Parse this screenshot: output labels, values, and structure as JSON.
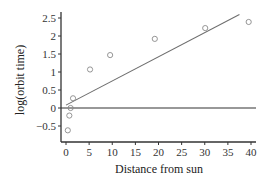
{
  "chart_data": {
    "type": "scatter",
    "title": "",
    "xlabel": "Distance from sun",
    "ylabel": "log(orbit time)",
    "xlim": [
      0,
      40
    ],
    "ylim": [
      -0.9,
      2.7
    ],
    "xticks": [
      0,
      5,
      10,
      15,
      20,
      25,
      30,
      35,
      40
    ],
    "xtick_labels": [
      "0",
      "5",
      "10",
      "15",
      "20",
      "25",
      "30",
      "35",
      "40"
    ],
    "yticks": [
      2.5,
      2,
      1.5,
      1,
      0.5,
      0,
      -0.5
    ],
    "ytick_labels": [
      "2.5",
      "2",
      "1.5",
      "1",
      "0.5",
      "0",
      "−0.5"
    ],
    "grid": false,
    "legend": null,
    "series": [
      {
        "name": "planets",
        "marker": "open-circle",
        "x": [
          0.39,
          0.72,
          1.0,
          1.52,
          5.2,
          9.54,
          19.2,
          30.1,
          39.5
        ],
        "y": [
          -0.62,
          -0.21,
          0.0,
          0.27,
          1.07,
          1.47,
          1.92,
          2.22,
          2.39
        ]
      }
    ],
    "reference_lines": [
      {
        "name": "zero-line",
        "type": "horizontal",
        "y": 0
      },
      {
        "name": "fit-line",
        "type": "line",
        "x": [
          0,
          37.5
        ],
        "y": [
          0.08,
          2.6
        ]
      }
    ],
    "colors": {
      "axis": "#333333",
      "line": "#6e6e6e",
      "marker": "#8a8a8a"
    }
  }
}
